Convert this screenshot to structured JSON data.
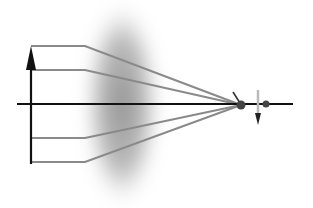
{
  "diagram": {
    "type": "thin-lens-ray-diagram",
    "colors": {
      "background": "#ffffff",
      "axis": "#111111",
      "object_arrow": "#111111",
      "rays": "#8a8a8a",
      "lens": "#9a9a9a",
      "focal_point": "#444444",
      "image_arrow": "#222222",
      "image_arrow_faint": "#bbbbbb"
    },
    "optical_axis": {
      "x1": 17,
      "x2": 293,
      "y": 104
    },
    "lens": {
      "cx": 122,
      "cy": 104,
      "rx": 36,
      "ry": 100
    },
    "object_arrow": {
      "x": 31,
      "y_base": 164,
      "y_tip": 46
    },
    "rays": [
      {
        "start_y": 46,
        "bend_x": 85
      },
      {
        "start_y": 70,
        "bend_x": 85
      },
      {
        "start_y": 138,
        "bend_x": 85
      },
      {
        "start_y": 162,
        "bend_x": 85
      }
    ],
    "focal_point": {
      "x": 241,
      "y": 105,
      "r": 4.5
    },
    "second_point": {
      "x": 266,
      "y": 104,
      "r": 3.5
    },
    "focal_tick": {
      "x1": 233,
      "y1": 92,
      "x2": 240,
      "y2": 103
    },
    "image_arrow": {
      "x": 258,
      "y_top": 90,
      "y_tip": 125
    }
  }
}
